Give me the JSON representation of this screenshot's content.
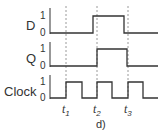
{
  "diagram": {
    "type": "timing-diagram",
    "caption": "d)",
    "signals": [
      {
        "name": "D",
        "high_label": "1",
        "low_label": "0",
        "high_y": 16,
        "low_y": 33,
        "edges": [
          {
            "x": 93,
            "to": 1
          },
          {
            "x": 124,
            "to": 0
          }
        ]
      },
      {
        "name": "Q",
        "high_label": "1",
        "low_label": "0",
        "high_y": 49,
        "low_y": 66,
        "edges": [
          {
            "x": 97,
            "to": 1
          },
          {
            "x": 127,
            "to": 0
          }
        ]
      },
      {
        "name": "Clock",
        "high_label": "1",
        "low_label": "0",
        "high_y": 82,
        "low_y": 98,
        "edges": [
          {
            "x": 66,
            "to": 1
          },
          {
            "x": 82,
            "to": 0
          },
          {
            "x": 97,
            "to": 1
          },
          {
            "x": 112,
            "to": 0
          },
          {
            "x": 128,
            "to": 1
          },
          {
            "x": 143,
            "to": 0
          }
        ]
      }
    ],
    "markers": [
      {
        "label": "t",
        "sub": "1",
        "x": 66
      },
      {
        "label": "t",
        "sub": "2",
        "x": 97
      },
      {
        "label": "t",
        "sub": "3",
        "x": 128
      }
    ],
    "axis_x": 50,
    "end_x": 158,
    "colors": {
      "line": "#333333",
      "dash": "#999999"
    }
  }
}
